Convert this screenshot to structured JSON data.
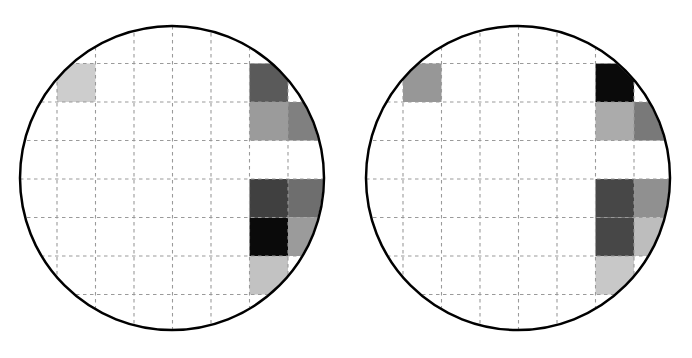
{
  "figure": {
    "type": "wafer-map-pair",
    "title": "",
    "background_color": "#ffffff",
    "width": 692,
    "height": 358
  },
  "chart_data": {
    "type": "heatmap",
    "title": "",
    "subtitle": "",
    "xlabel": "",
    "ylabel": "",
    "legend": [],
    "annotations": [],
    "grid": true,
    "grid_style": "dashed",
    "grid_color": "#9a9a9a",
    "colormap": "grayscale",
    "colormap_note": "darker = higher value",
    "panel_count": 2,
    "cell_size_px": 38.5,
    "panels": [
      {
        "name": "wafer-map-left",
        "shape": "circle",
        "center_x": 172,
        "center_y": 178,
        "radius": 152,
        "outline_color": "#000000",
        "outline_width": 2.5,
        "cols": 8,
        "rows": 8,
        "origin_x": 57,
        "origin_y": 25,
        "cells": [
          {
            "col": 0,
            "row": 1,
            "value": 0.19,
            "color": "#cdcdcd"
          },
          {
            "col": 5,
            "row": 1,
            "value": 0.65,
            "color": "#5a5a5a"
          },
          {
            "col": 5,
            "row": 2,
            "value": 0.4,
            "color": "#9b9b9b"
          },
          {
            "col": 6,
            "row": 2,
            "value": 0.5,
            "color": "#808080"
          },
          {
            "col": 5,
            "row": 4,
            "value": 0.75,
            "color": "#404040"
          },
          {
            "col": 6,
            "row": 4,
            "value": 0.57,
            "color": "#6e6e6e"
          },
          {
            "col": 5,
            "row": 5,
            "value": 0.97,
            "color": "#0a0a0a"
          },
          {
            "col": 6,
            "row": 5,
            "value": 0.4,
            "color": "#9b9b9b"
          },
          {
            "col": 5,
            "row": 6,
            "value": 0.24,
            "color": "#c2c2c2"
          }
        ]
      },
      {
        "name": "wafer-map-right",
        "shape": "circle",
        "center_x": 518,
        "center_y": 178,
        "radius": 152,
        "outline_color": "#000000",
        "outline_width": 2.5,
        "cols": 8,
        "rows": 8,
        "origin_x": 403,
        "origin_y": 25,
        "cells": [
          {
            "col": 0,
            "row": 1,
            "value": 0.42,
            "color": "#979797"
          },
          {
            "col": 5,
            "row": 1,
            "value": 0.97,
            "color": "#0a0a0a"
          },
          {
            "col": 5,
            "row": 2,
            "value": 0.33,
            "color": "#ababab"
          },
          {
            "col": 6,
            "row": 2,
            "value": 0.53,
            "color": "#797979"
          },
          {
            "col": 5,
            "row": 4,
            "value": 0.72,
            "color": "#474747"
          },
          {
            "col": 6,
            "row": 4,
            "value": 0.45,
            "color": "#909090"
          },
          {
            "col": 5,
            "row": 5,
            "value": 0.72,
            "color": "#474747"
          },
          {
            "col": 6,
            "row": 5,
            "value": 0.26,
            "color": "#bdbdbd"
          },
          {
            "col": 5,
            "row": 6,
            "value": 0.22,
            "color": "#c8c8c8"
          }
        ]
      }
    ]
  }
}
